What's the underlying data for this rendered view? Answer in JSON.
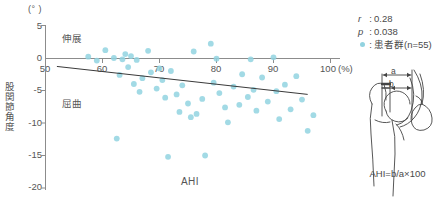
{
  "chart_data": {
    "type": "scatter",
    "title": "",
    "xlabel": "AHI",
    "ylabel": "股関節角度",
    "x_unit": "(%)",
    "y_unit": "(°)",
    "xlim": [
      50,
      100
    ],
    "ylim": [
      -20,
      5
    ],
    "xticks": [
      50,
      60,
      70,
      80,
      90,
      100
    ],
    "yticks": [
      5,
      0,
      -5,
      -10,
      -15,
      -20
    ],
    "grid": false,
    "direction_labels": {
      "positive": "伸展",
      "negative": "屈曲"
    },
    "series": [
      {
        "name": "患者群(n=55)",
        "color": "#92d3e0",
        "points": [
          [
            57.5,
            0.2
          ],
          [
            59.0,
            -0.4
          ],
          [
            60.5,
            1.2
          ],
          [
            62.0,
            0.0
          ],
          [
            63.0,
            -2.6
          ],
          [
            63.5,
            -0.2
          ],
          [
            64.0,
            0.6
          ],
          [
            64.5,
            -1.4
          ],
          [
            65.0,
            0.3
          ],
          [
            65.5,
            -4.0
          ],
          [
            66.0,
            -0.3
          ],
          [
            66.5,
            -5.2
          ],
          [
            67.0,
            -3.1
          ],
          [
            68.0,
            1.1
          ],
          [
            68.5,
            -2.2
          ],
          [
            69.5,
            -4.7
          ],
          [
            70.0,
            -1.6
          ],
          [
            70.5,
            -3.4
          ],
          [
            71.0,
            -6.1
          ],
          [
            72.0,
            -2.0
          ],
          [
            73.0,
            -5.6
          ],
          [
            73.5,
            -8.3
          ],
          [
            74.0,
            -4.2
          ],
          [
            75.0,
            -7.0
          ],
          [
            75.5,
            -9.1
          ],
          [
            76.0,
            1.0
          ],
          [
            76.5,
            -8.6
          ],
          [
            77.5,
            -6.3
          ],
          [
            78.0,
            -15.0
          ],
          [
            79.0,
            2.2
          ],
          [
            79.5,
            -3.8
          ],
          [
            80.0,
            -0.1
          ],
          [
            80.5,
            -5.4
          ],
          [
            81.5,
            -7.6
          ],
          [
            82.0,
            -9.9
          ],
          [
            83.0,
            -4.4
          ],
          [
            84.0,
            -7.2
          ],
          [
            84.5,
            -2.5
          ],
          [
            85.5,
            -6.0
          ],
          [
            86.0,
            -0.2
          ],
          [
            86.5,
            -4.9
          ],
          [
            87.0,
            -8.1
          ],
          [
            88.0,
            -3.0
          ],
          [
            89.0,
            -6.7
          ],
          [
            90.0,
            0.1
          ],
          [
            90.5,
            -5.1
          ],
          [
            91.0,
            -9.4
          ],
          [
            92.0,
            -4.1
          ],
          [
            93.0,
            -7.9
          ],
          [
            94.0,
            -2.8
          ],
          [
            95.0,
            -6.4
          ],
          [
            96.0,
            -11.2
          ],
          [
            97.0,
            -8.8
          ],
          [
            62.5,
            -12.4
          ],
          [
            71.5,
            -15.2
          ]
        ]
      }
    ],
    "regression_line": {
      "x0": 52.0,
      "y0": -1.3,
      "x1": 96.0,
      "y1": -5.6,
      "color": "#3a3a3a"
    },
    "stats": {
      "r_symbol": "r",
      "r_value": "0.28",
      "p_symbol": "p",
      "p_value": "0.038"
    }
  },
  "axes": {
    "unit_top": "(° )",
    "y_title": "股関節角度",
    "x_title": "AHI",
    "x_unit_suffix": "(%)",
    "x_tick_labels": [
      "50",
      "60",
      "70",
      "80",
      "90",
      "100"
    ],
    "y_tick_labels": [
      "5",
      "0",
      "-5",
      "-10",
      "-15",
      "-20"
    ],
    "extension_label": "伸展",
    "flexion_label": "屈曲"
  },
  "legend": {
    "r_label": "r",
    "r_value": "0.28",
    "p_label": "p",
    "p_value": "0.038",
    "group_label": "患者群(n=55)",
    "colon": ":"
  },
  "anatomy": {
    "dim_a": "a",
    "dim_b": "b",
    "formula": "AHI=b/a×100",
    "caption": "hip-joint-ahi-measurement"
  }
}
